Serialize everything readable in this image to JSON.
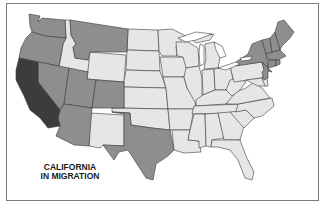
{
  "map": {
    "title_line1": "CALIFORNIA",
    "title_line2": "IN MIGRATION",
    "colors": {
      "origin": "#3c3c3c",
      "high": "#8e8e8e",
      "low": "#e6e6e6",
      "border": "#3a3a3a",
      "frame": "#7a7a7a"
    },
    "legend_states": {
      "origin": [
        "California"
      ],
      "high": [
        "Washington",
        "Oregon",
        "Nevada",
        "Arizona",
        "Utah",
        "Colorado",
        "Montana",
        "Texas",
        "New York",
        "Vermont",
        "New Hampshire",
        "Maine",
        "Massachusetts",
        "Connecticut",
        "Rhode Island",
        "New Jersey"
      ],
      "low": [
        "Idaho",
        "Wyoming",
        "New Mexico",
        "North Dakota",
        "South Dakota",
        "Nebraska",
        "Kansas",
        "Oklahoma",
        "Minnesota",
        "Iowa",
        "Missouri",
        "Arkansas",
        "Louisiana",
        "Wisconsin",
        "Illinois",
        "Michigan",
        "Indiana",
        "Ohio",
        "Kentucky",
        "Tennessee",
        "Mississippi",
        "Alabama",
        "Georgia",
        "Florida",
        "South Carolina",
        "North Carolina",
        "Virginia",
        "West Virginia",
        "Pennsylvania",
        "Maryland",
        "Delaware"
      ]
    }
  }
}
